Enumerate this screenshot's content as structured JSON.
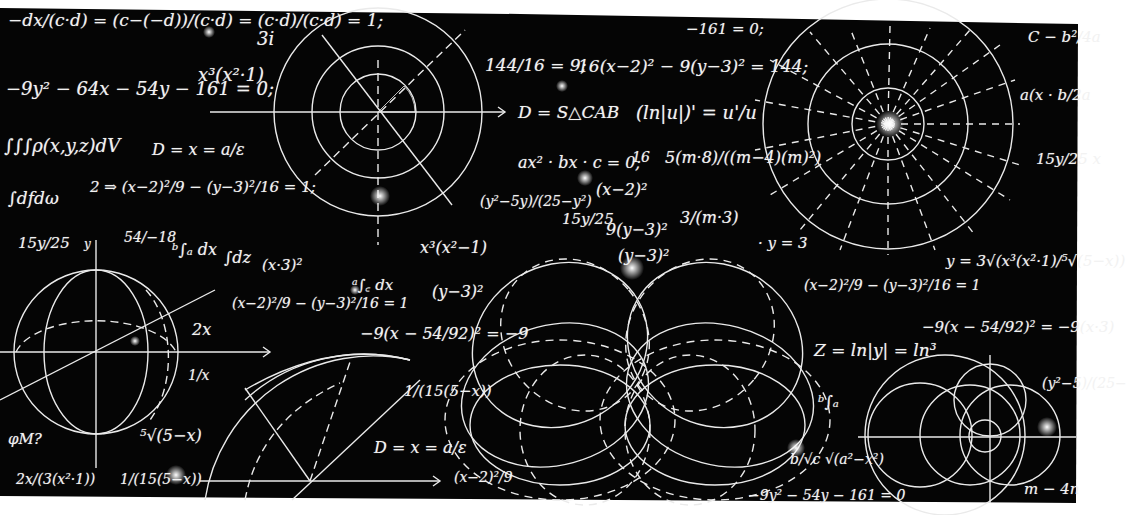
{
  "board": {
    "background": "#050505",
    "chalk": "#f0f0f0",
    "outside": "#ffffff"
  },
  "formulas": [
    {
      "id": "f1",
      "text": "−dx/(c·d) = (c−(−d))/(c·d) = (c·d)/(c·d) = 1;",
      "x": 8,
      "y": 12,
      "size": 17
    },
    {
      "id": "f2",
      "text": "3i",
      "x": 257,
      "y": 30,
      "size": 18
    },
    {
      "id": "f3",
      "text": "−9y² − 64x − 54y − 161 = 0;",
      "x": 6,
      "y": 80,
      "size": 18
    },
    {
      "id": "f4",
      "text": "x³(x²·1)",
      "x": 198,
      "y": 66,
      "size": 18
    },
    {
      "id": "f5",
      "text": "−161 = 0;",
      "x": 686,
      "y": 22,
      "size": 15
    },
    {
      "id": "f6",
      "text": "144/16 = 9;",
      "x": 485,
      "y": 57,
      "size": 17
    },
    {
      "id": "f7",
      "text": "16(x−2)² − 9(y−3)² = 144;",
      "x": 578,
      "y": 58,
      "size": 17
    },
    {
      "id": "f8",
      "text": "D = S△CAB",
      "x": 518,
      "y": 104,
      "size": 17
    },
    {
      "id": "f9",
      "text": "(ln|u|)' = u'/u",
      "x": 636,
      "y": 104,
      "size": 18
    },
    {
      "id": "f10",
      "text": "C − b²/4a",
      "x": 1028,
      "y": 30,
      "size": 15
    },
    {
      "id": "f11",
      "text": "a(x · b/2a",
      "x": 1020,
      "y": 88,
      "size": 15
    },
    {
      "id": "f12",
      "text": "15y/25 x",
      "x": 1036,
      "y": 152,
      "size": 15
    },
    {
      "id": "f13",
      "text": "∫∫∫ρ(x,y,z)dV",
      "x": 4,
      "y": 137,
      "size": 18
    },
    {
      "id": "f14",
      "text": "D = x = a/ε",
      "x": 152,
      "y": 142,
      "size": 16
    },
    {
      "id": "f15",
      "text": "∫dfdω",
      "x": 8,
      "y": 190,
      "size": 17
    },
    {
      "id": "f16",
      "text": "2 ⇒ (x−2)²/9 − (y−3)²/16 = 1;",
      "x": 90,
      "y": 180,
      "size": 15
    },
    {
      "id": "f17",
      "text": "ax² · bx · c = 0;",
      "x": 518,
      "y": 155,
      "size": 16
    },
    {
      "id": "f18",
      "text": "16",
      "x": 632,
      "y": 150,
      "size": 14
    },
    {
      "id": "f19",
      "text": "5(m·8)/((m−4)(m)²)",
      "x": 665,
      "y": 150,
      "size": 16
    },
    {
      "id": "f20",
      "text": "(x−2)²",
      "x": 596,
      "y": 182,
      "size": 16
    },
    {
      "id": "f21",
      "text": "(y²−5y)/(25−y²)",
      "x": 480,
      "y": 194,
      "size": 14
    },
    {
      "id": "f22",
      "text": "15y/25",
      "x": 562,
      "y": 212,
      "size": 15
    },
    {
      "id": "f23",
      "text": "9(y−3)²",
      "x": 606,
      "y": 222,
      "size": 16
    },
    {
      "id": "f24",
      "text": "3/(m·3)",
      "x": 680,
      "y": 210,
      "size": 16
    },
    {
      "id": "f25",
      "text": "· y = 3",
      "x": 758,
      "y": 236,
      "size": 15
    },
    {
      "id": "f26",
      "text": "(y−3)²",
      "x": 618,
      "y": 248,
      "size": 16
    },
    {
      "id": "f27",
      "text": "15y/25",
      "x": 18,
      "y": 236,
      "size": 15
    },
    {
      "id": "f28",
      "text": "y",
      "x": 84,
      "y": 238,
      "size": 12
    },
    {
      "id": "f29",
      "text": "54/−18",
      "x": 124,
      "y": 230,
      "size": 14
    },
    {
      "id": "f30",
      "text": "ᵇ∫ₐ dx",
      "x": 172,
      "y": 242,
      "size": 16
    },
    {
      "id": "f31",
      "text": "∫dz",
      "x": 224,
      "y": 250,
      "size": 16
    },
    {
      "id": "f32",
      "text": "(x·3)²",
      "x": 262,
      "y": 258,
      "size": 15
    },
    {
      "id": "f33",
      "text": "x³(x²−1)",
      "x": 420,
      "y": 240,
      "size": 16
    },
    {
      "id": "f34",
      "text": "ᵃ∫꜀ dx",
      "x": 352,
      "y": 278,
      "size": 15
    },
    {
      "id": "f35",
      "text": "(y−3)²",
      "x": 432,
      "y": 284,
      "size": 16
    },
    {
      "id": "f36",
      "text": "2x",
      "x": 192,
      "y": 322,
      "size": 16
    },
    {
      "id": "f37",
      "text": "(x−2)²/9 − (y−3)²/16 = 1",
      "x": 232,
      "y": 296,
      "size": 14
    },
    {
      "id": "f38",
      "text": "−9(x − 54/92)² = −9",
      "x": 360,
      "y": 326,
      "size": 16
    },
    {
      "id": "f39",
      "text": "(x−2)²/9 − (y−3)²/16 = 1",
      "x": 804,
      "y": 278,
      "size": 14
    },
    {
      "id": "f40",
      "text": "y = 3√(x³(x²·1)/⁵√(5−x))",
      "x": 946,
      "y": 254,
      "size": 15
    },
    {
      "id": "f41",
      "text": "Z = ln|y| = ln³",
      "x": 814,
      "y": 342,
      "size": 17
    },
    {
      "id": "f42",
      "text": "−9(x − 54/92)² = −9(x·3)",
      "x": 922,
      "y": 320,
      "size": 15
    },
    {
      "id": "f43",
      "text": "1/x",
      "x": 188,
      "y": 368,
      "size": 14
    },
    {
      "id": "f44",
      "text": "1/(15(5−x))",
      "x": 404,
      "y": 384,
      "size": 15
    },
    {
      "id": "f45",
      "text": "φM?",
      "x": 8,
      "y": 432,
      "size": 15
    },
    {
      "id": "f46",
      "text": "⁵√(5−x)",
      "x": 140,
      "y": 428,
      "size": 16
    },
    {
      "id": "f47",
      "text": "D = x = a/ε",
      "x": 374,
      "y": 440,
      "size": 16
    },
    {
      "id": "f48",
      "text": "ᵇ∫ₐ",
      "x": 818,
      "y": 394,
      "size": 16
    },
    {
      "id": "f49",
      "text": "b/√c √(a²−x²)",
      "x": 790,
      "y": 452,
      "size": 14
    },
    {
      "id": "f50",
      "text": "(y²−5)/(25−",
      "x": 1042,
      "y": 376,
      "size": 14
    },
    {
      "id": "f51",
      "text": "2x/(3(x²·1))",
      "x": 16,
      "y": 472,
      "size": 14
    },
    {
      "id": "f52",
      "text": "1/(15(5−x))",
      "x": 120,
      "y": 472,
      "size": 14
    },
    {
      "id": "f53",
      "text": "(x−2)²/9",
      "x": 454,
      "y": 470,
      "size": 14
    },
    {
      "id": "f54",
      "text": "−9y² − 54y − 161 = 0",
      "x": 748,
      "y": 488,
      "size": 14
    },
    {
      "id": "f55",
      "text": "m − 4n",
      "x": 1024,
      "y": 482,
      "size": 15
    }
  ],
  "diagram_labels": {
    "concentric": [
      "k",
      "x₁",
      "x₂",
      "x₃",
      "μ₁",
      "μ₂",
      "μ₃",
      "ψ₁",
      "ψ₂",
      "ψ₃",
      "ι₁",
      "ι₂",
      "ι₃"
    ],
    "sphere": [
      "y",
      "z",
      "x"
    ],
    "sector": [
      "e",
      "e₁",
      "y₁",
      "z",
      "S",
      "y"
    ],
    "bipolar": [
      "y",
      "μ₁",
      "μ₂",
      "μ₃"
    ]
  }
}
